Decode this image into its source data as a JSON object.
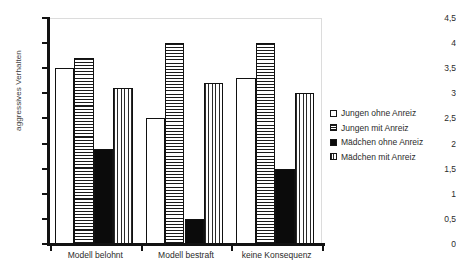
{
  "chart_data": {
    "type": "bar",
    "title": "",
    "xlabel": "",
    "ylabel": "aggressives Verhalten",
    "categories": [
      "Modell belohnt",
      "Modell bestraft",
      "keine Konsequenz"
    ],
    "series": [
      {
        "name": "Jungen ohne Anreiz",
        "values": [
          3.5,
          2.5,
          3.3
        ]
      },
      {
        "name": "Jungen mit Anreiz",
        "values": [
          3.7,
          4.0,
          4.0
        ]
      },
      {
        "name": "Mädchen ohne Anreiz",
        "values": [
          1.9,
          0.5,
          1.5
        ]
      },
      {
        "name": "Mädchen mit Anreiz",
        "values": [
          3.1,
          3.2,
          3.0
        ]
      }
    ],
    "ylim": [
      0,
      4.5
    ],
    "ytick_values": [
      0,
      0.5,
      1,
      1.5,
      2,
      2.5,
      3,
      3.5,
      4,
      4.5
    ],
    "ytick_labels": [
      "0",
      "0,5",
      "1",
      "1,5",
      "2",
      "2,5",
      "3",
      "3,5",
      "4",
      "4,5"
    ],
    "grid": false,
    "legend_position": "right",
    "colors": {
      "series_0_fill": "#ffffff",
      "series_1_fill": "#ffffff",
      "series_1_pattern": "horizontal-lines",
      "series_2_fill": "#0b0b0b",
      "series_3_fill": "#ffffff",
      "series_3_pattern": "vertical-lines",
      "bar_outline": "#111111",
      "axis": "#121212",
      "plot_border": "#dcdcdc",
      "text": "#2b2b2b"
    }
  },
  "legend": {
    "items": [
      {
        "label": "Jungen ohne Anreiz"
      },
      {
        "label": "Jungen mit Anreiz"
      },
      {
        "label": "Mädchen ohne Anreiz"
      },
      {
        "label": "Mädchen mit Anreiz"
      }
    ]
  }
}
